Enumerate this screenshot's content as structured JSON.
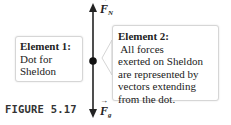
{
  "figure": {
    "caption": "FIGURE 5.17",
    "vectors": [
      {
        "name": "F",
        "subscript": "N",
        "direction": "up"
      },
      {
        "name": "F",
        "subscript": "g",
        "direction": "down"
      }
    ],
    "element1": {
      "title": "Element 1:",
      "text_line1": "Dot for",
      "text_line2": "Sheldon"
    },
    "element2": {
      "title": "Element 2:",
      "title_rest": " All forces",
      "lines": [
        "exerted on Sheldon",
        "are represented by",
        "vectors extending",
        "from the dot."
      ]
    }
  }
}
